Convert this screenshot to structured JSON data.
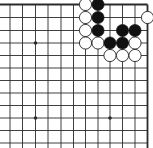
{
  "diagram": {
    "type": "go-board-fragment",
    "region": "top-right corner",
    "board_size": 19,
    "visible_columns": 12,
    "visible_rows": 12,
    "column_x": [
      10,
      22.5,
      35.5,
      48,
      61,
      73.5,
      85.5,
      98,
      110,
      122.5,
      135,
      147.5
    ],
    "row_y": [
      4.5,
      17.5,
      30.5,
      43,
      55.5,
      68,
      80.5,
      93,
      105.5,
      118,
      130.5,
      143
    ],
    "edges": {
      "top": true,
      "right": true
    },
    "colors": {
      "line": "#2a2a2a",
      "black_stone": "#111111",
      "white_stone": "#ffffff",
      "stone_outline": "#222222",
      "background": "#ffffff"
    },
    "star_points": [
      {
        "col": 2,
        "row": 3
      },
      {
        "col": 2,
        "row": 9
      },
      {
        "col": 8,
        "row": 9
      }
    ],
    "black_stones": [
      {
        "col": 7,
        "row": 0
      },
      {
        "col": 7,
        "row": 1
      },
      {
        "col": 7,
        "row": 2
      },
      {
        "col": 9,
        "row": 2
      },
      {
        "col": 10,
        "row": 2
      },
      {
        "col": 8,
        "row": 3
      },
      {
        "col": 9,
        "row": 3
      }
    ],
    "white_stones": [
      {
        "col": 6,
        "row": 0
      },
      {
        "col": 6,
        "row": 1
      },
      {
        "col": 11,
        "row": 1
      },
      {
        "col": 6,
        "row": 2
      },
      {
        "col": 6,
        "row": 3
      },
      {
        "col": 7,
        "row": 3
      },
      {
        "col": 10,
        "row": 3
      },
      {
        "col": 8,
        "row": 4
      },
      {
        "col": 9,
        "row": 4
      },
      {
        "col": 10,
        "row": 4
      }
    ]
  }
}
